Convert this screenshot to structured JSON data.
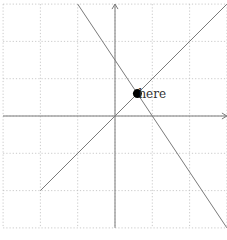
{
  "diagram": {
    "type": "coordinate-plane",
    "grid": {
      "style": "dotted",
      "color": "#bdbdbd",
      "x_range": [
        -3,
        3
      ],
      "y_range": [
        -3,
        3
      ],
      "step": 1
    },
    "axes": {
      "color": "#7a7a7a",
      "x_axis": {
        "from": -3,
        "to": 3,
        "arrow": true
      },
      "y_axis": {
        "from": -3,
        "to": 3,
        "arrow": true
      }
    },
    "lines": [
      {
        "name": "line-y-equals-x",
        "from": [
          -2,
          -2
        ],
        "to": [
          3,
          3
        ],
        "color": "#7a7a7a"
      },
      {
        "name": "line-negative-slope",
        "from": [
          -1,
          3
        ],
        "to": [
          3,
          -3
        ],
        "color": "#7a7a7a"
      }
    ],
    "point": {
      "label": "here",
      "coords": [
        0.6,
        0.6
      ],
      "color": "#000000"
    }
  }
}
